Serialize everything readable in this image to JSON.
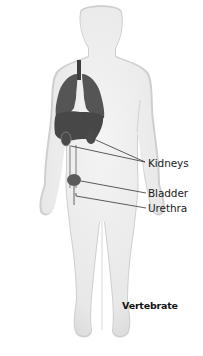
{
  "figure": {
    "caption": "Vertebrate",
    "colors": {
      "background": "#ffffff",
      "body_fill": "#ececec",
      "body_shadow": "#c9c9c9",
      "organ_fill": "#555555",
      "organ_dark": "#3e3e3e",
      "leader_line": "#333333",
      "text": "#1a1a1a"
    }
  },
  "labels": [
    {
      "id": "kidneys",
      "text": "Kidneys"
    },
    {
      "id": "bladder",
      "text": "Bladder"
    },
    {
      "id": "urethra",
      "text": "Urethra"
    }
  ],
  "organs_depicted": [
    "trachea",
    "lungs",
    "liver",
    "kidneys",
    "ureters",
    "bladder",
    "urethra"
  ]
}
